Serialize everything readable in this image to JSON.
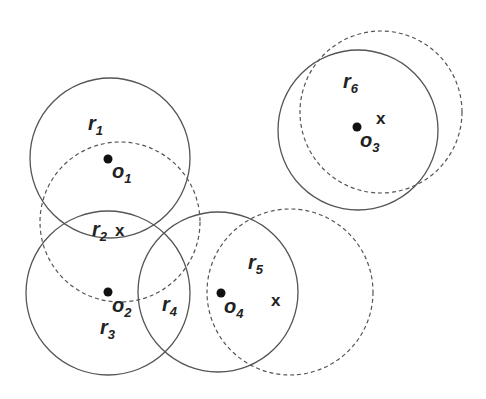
{
  "diagram": {
    "colors": {
      "stroke": "#555555",
      "dot": "#111111",
      "text": "#222222",
      "background": "#ffffff"
    },
    "solid_circles": [
      {
        "id": "c-o1",
        "cx": 110,
        "cy": 158,
        "r": 80
      },
      {
        "id": "c-o2",
        "cx": 108,
        "cy": 293,
        "r": 82
      },
      {
        "id": "c-o4",
        "cx": 218,
        "cy": 292,
        "r": 80
      },
      {
        "id": "c-o3",
        "cx": 358,
        "cy": 130,
        "r": 80
      }
    ],
    "dashed_circles": [
      {
        "id": "d-r2",
        "cx": 120,
        "cy": 222,
        "r": 80
      },
      {
        "id": "d-r5",
        "cx": 290,
        "cy": 292,
        "r": 83
      },
      {
        "id": "d-r6",
        "cx": 381,
        "cy": 112,
        "r": 81
      }
    ],
    "centers": [
      {
        "name": "o",
        "sub": "1",
        "dot": [
          108,
          159
        ],
        "label": [
          112,
          178
        ]
      },
      {
        "name": "o",
        "sub": "2",
        "dot": [
          108,
          292
        ],
        "label": [
          112,
          312
        ]
      },
      {
        "name": "o",
        "sub": "4",
        "dot": [
          221,
          293
        ],
        "label": [
          224,
          313
        ]
      },
      {
        "name": "o",
        "sub": "3",
        "dot": [
          357,
          127
        ],
        "label": [
          360,
          147
        ]
      }
    ],
    "regions": [
      {
        "name": "r",
        "sub": "1",
        "pos": [
          88,
          130
        ]
      },
      {
        "name": "r",
        "sub": "2",
        "pos": [
          92,
          236
        ]
      },
      {
        "name": "r",
        "sub": "3",
        "pos": [
          100,
          334
        ]
      },
      {
        "name": "r",
        "sub": "4",
        "pos": [
          162,
          311
        ]
      },
      {
        "name": "r",
        "sub": "5",
        "pos": [
          248,
          269
        ]
      },
      {
        "name": "r",
        "sub": "6",
        "pos": [
          343,
          88
        ]
      }
    ],
    "x_marks": [
      {
        "label": "x",
        "pos": [
          115,
          236
        ]
      },
      {
        "label": "x",
        "pos": [
          271,
          306
        ]
      },
      {
        "label": "x",
        "pos": [
          376,
          124
        ]
      }
    ]
  }
}
